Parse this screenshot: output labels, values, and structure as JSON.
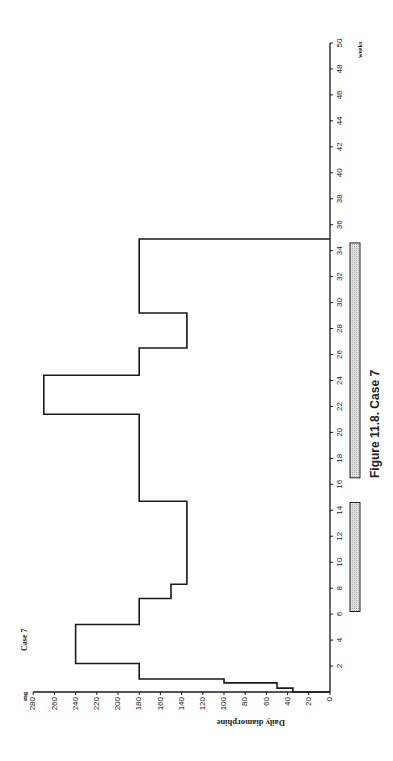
{
  "figure": {
    "caption": "Figure 11.8.  Case 7",
    "panel_label": "Case 7",
    "orientation": "rotated 90° counter-clockwise"
  },
  "axes": {
    "value_axis": {
      "label": "Daily diamorphine",
      "unit": "mg",
      "ticks": [
        0,
        20,
        40,
        60,
        80,
        100,
        120,
        140,
        160,
        180,
        200,
        220,
        240,
        260,
        280
      ]
    },
    "time_axis": {
      "unit": "weeks",
      "ticks": [
        2,
        4,
        6,
        8,
        10,
        12,
        14,
        16,
        18,
        20,
        22,
        24,
        26,
        28,
        30,
        32,
        34,
        36,
        38,
        40,
        42,
        44,
        46,
        48,
        50
      ]
    }
  },
  "colors": {
    "line": "#1a1a1a",
    "bar_fill": "#c8c8c8",
    "bar_stroke": "#222222",
    "text": "#222222"
  },
  "chart_data": {
    "type": "line",
    "subtype": "step",
    "title": "Figure 11.8. Case 7",
    "xlabel": "weeks",
    "ylabel": "Daily diamorphine (mg)",
    "xlim": [
      0,
      50
    ],
    "ylim": [
      0,
      280
    ],
    "grid": false,
    "legend": null,
    "series": [
      {
        "name": "Daily diamorphine",
        "steps": [
          {
            "from_week": 0.0,
            "to_week": 0.3,
            "mg": 35
          },
          {
            "from_week": 0.3,
            "to_week": 0.7,
            "mg": 50
          },
          {
            "from_week": 0.7,
            "to_week": 1.0,
            "mg": 100
          },
          {
            "from_week": 1.0,
            "to_week": 2.2,
            "mg": 180
          },
          {
            "from_week": 2.2,
            "to_week": 5.2,
            "mg": 240
          },
          {
            "from_week": 5.2,
            "to_week": 7.2,
            "mg": 180
          },
          {
            "from_week": 7.2,
            "to_week": 8.3,
            "mg": 150
          },
          {
            "from_week": 8.3,
            "to_week": 14.7,
            "mg": 135
          },
          {
            "from_week": 14.7,
            "to_week": 21.4,
            "mg": 180
          },
          {
            "from_week": 21.4,
            "to_week": 24.4,
            "mg": 270
          },
          {
            "from_week": 24.4,
            "to_week": 26.5,
            "mg": 180
          },
          {
            "from_week": 26.5,
            "to_week": 29.2,
            "mg": 135
          },
          {
            "from_week": 29.2,
            "to_week": 34.9,
            "mg": 180
          }
        ],
        "end_week": 34.9,
        "end_value": 0
      }
    ],
    "annotations": [
      {
        "type": "shaded_bar",
        "from_week": 6.2,
        "to_week": 14.6
      },
      {
        "type": "shaded_bar",
        "from_week": 16.5,
        "to_week": 34.6
      }
    ]
  }
}
